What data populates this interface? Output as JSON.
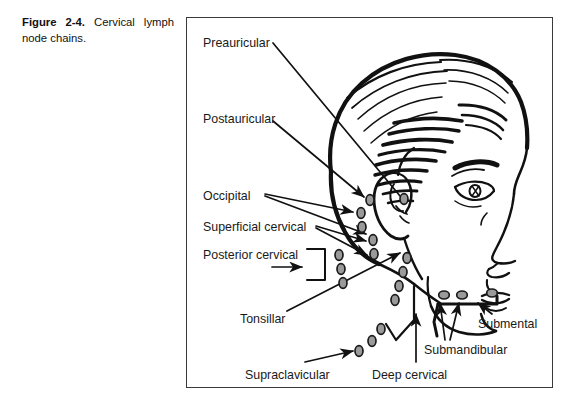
{
  "caption": {
    "label": "Figure 2-4.",
    "text": " Cervical lymph node chains."
  },
  "figure": {
    "title": "Cervical lymph node chains",
    "colors": {
      "ink": "#111111",
      "node_fill": "#9a9a9a",
      "node_stroke": "#1a1a1a",
      "frame": "#3a3a3a",
      "background": "#ffffff"
    }
  },
  "labels": [
    {
      "id": "preauricular",
      "text": "Preauricular",
      "x": 203,
      "y": 37,
      "align": "left"
    },
    {
      "id": "postauricular",
      "text": "Postauricular",
      "x": 203,
      "y": 113,
      "align": "left"
    },
    {
      "id": "occipital",
      "text": "Occipital",
      "x": 203,
      "y": 190,
      "align": "left"
    },
    {
      "id": "superficial-cervical",
      "text": "Superficial cervical",
      "x": 203,
      "y": 221,
      "align": "left"
    },
    {
      "id": "posterior-cervical",
      "text": "Posterior cervical",
      "x": 203,
      "y": 249,
      "align": "left"
    },
    {
      "id": "tonsillar",
      "text": "Tonsillar",
      "x": 240,
      "y": 313,
      "align": "left"
    },
    {
      "id": "supraclavicular",
      "text": "Supraclavicular",
      "x": 245,
      "y": 369,
      "align": "left"
    },
    {
      "id": "deep-cervical",
      "text": "Deep cervical",
      "x": 372,
      "y": 369,
      "align": "left"
    },
    {
      "id": "submandibular",
      "text": "Submandibular",
      "x": 424,
      "y": 344,
      "align": "left"
    },
    {
      "id": "submental",
      "text": "Submental",
      "x": 478,
      "y": 318,
      "align": "left"
    }
  ],
  "node_groups": [
    {
      "id": "preauricular-node",
      "nodes": [
        [
          404,
          199
        ]
      ]
    },
    {
      "id": "postauricular-node",
      "nodes": [
        [
          370,
          200
        ]
      ]
    },
    {
      "id": "occipital-nodes",
      "nodes": [
        [
          361,
          213
        ],
        [
          362,
          227
        ]
      ]
    },
    {
      "id": "superficial-cervical-nodes",
      "nodes": [
        [
          373,
          240
        ],
        [
          374,
          254
        ]
      ]
    },
    {
      "id": "posterior-cervical-nodes",
      "nodes": [
        [
          339,
          255
        ],
        [
          341,
          269
        ],
        [
          343,
          283
        ]
      ]
    },
    {
      "id": "tonsillar-nodes",
      "nodes": [
        [
          407,
          258
        ],
        [
          403,
          272
        ],
        [
          399,
          286
        ],
        [
          395,
          300
        ]
      ]
    },
    {
      "id": "supraclavicular-nodes",
      "nodes": [
        [
          359,
          351
        ],
        [
          372,
          341
        ],
        [
          381,
          329
        ]
      ]
    },
    {
      "id": "submandibular-nodes",
      "nodes": [
        [
          444,
          295
        ],
        [
          462,
          295
        ]
      ]
    },
    {
      "id": "submental-nodes",
      "nodes": [
        [
          492,
          293
        ]
      ]
    }
  ]
}
